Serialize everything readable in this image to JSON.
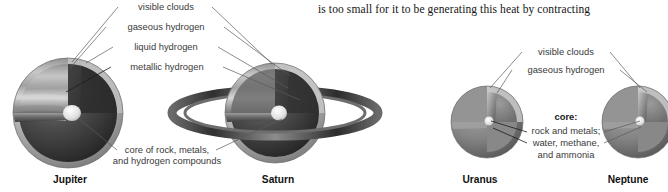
{
  "page": {
    "background_color": "#ffffff",
    "width": 662,
    "height": 192
  },
  "body_text": {
    "line": "is too small for it to be generating this heat by contracting"
  },
  "figure": {
    "caption_group_left": {
      "labels": [
        {
          "id": "visible-clouds",
          "text": "visible clouds"
        },
        {
          "id": "gaseous-hydrogen",
          "text": "gaseous hydrogen"
        },
        {
          "id": "liquid-hydrogen",
          "text": "liquid hydrogen"
        },
        {
          "id": "metallic-hydrogen",
          "text": "metallic hydrogen"
        }
      ],
      "core_label_line1": "core of rock, metals,",
      "core_label_line2": "and hydrogen compounds"
    },
    "caption_group_right": {
      "labels": [
        {
          "id": "visible-clouds-right",
          "text": "visible clouds"
        },
        {
          "id": "gaseous-hydrogen-right",
          "text": "gaseous hydrogen"
        }
      ],
      "core_heading": "core:",
      "core_line1": "rock and metals;",
      "core_line2": "water, methane,",
      "core_line3": "and ammonia"
    },
    "planets": [
      {
        "id": "jupiter",
        "name": "Jupiter"
      },
      {
        "id": "saturn",
        "name": "Saturn"
      },
      {
        "id": "uranus",
        "name": "Uranus"
      },
      {
        "id": "neptune",
        "name": "Neptune"
      }
    ],
    "colors": {
      "interior_dark": "#2f2f2f",
      "interior_mid": "#5d5d5d",
      "shell_light": "#c9c9c9",
      "shell_mid": "#9a9a9a",
      "core_highlight": "#ededed",
      "ring_dark": "#3c3c3c",
      "ring_light": "#bdbdbd",
      "leader_line": "#5a5a5a",
      "text": "#3a3a3a"
    }
  }
}
